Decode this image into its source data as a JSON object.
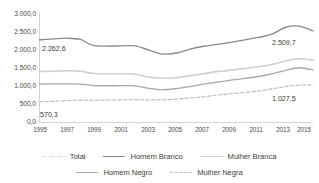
{
  "chart_data": {
    "type": "line",
    "title": "",
    "subtitle": "",
    "xlabel": "",
    "ylabel": "",
    "grid": false,
    "legend_position": "bottom",
    "x": [
      1995,
      1996,
      1997,
      1998,
      1999,
      2001,
      2002,
      2003,
      2004,
      2005,
      2006,
      2007,
      2008,
      2009,
      2011,
      2012,
      2013,
      2014,
      2015
    ],
    "xtick_labels": [
      "1995",
      "1997",
      "1999",
      "2001",
      "2003",
      "2005",
      "2007",
      "2009",
      "2011",
      "2013",
      "2015"
    ],
    "xtick_values": [
      1995,
      1997,
      1999,
      2001,
      2003,
      2005,
      2007,
      2009,
      2011,
      2013,
      2015
    ],
    "ytick_labels": [
      "0,0",
      "500,0",
      "1.000,0",
      "1.500,0",
      "2.000,0",
      "2.500,0",
      "3.000,0"
    ],
    "ytick_values": [
      0,
      500,
      1000,
      1500,
      2000,
      2500,
      3000
    ],
    "ylim": [
      0,
      3000
    ],
    "series": [
      {
        "name": "Total",
        "color": "#d6d6d6",
        "style": "dotted",
        "width": 1.3,
        "values": [
          1390,
          1398,
          1412,
          1402,
          1337,
          1330,
          1320,
          1240,
          1210,
          1225,
          1275,
          1330,
          1390,
          1430,
          1520,
          1585,
          1680,
          1742,
          1700
        ]
      },
      {
        "name": "Homem Branco",
        "color": "#8a8a8a",
        "style": "solid",
        "width": 1.35,
        "values": [
          2262.6,
          2290,
          2310,
          2275,
          2105,
          2100,
          2098,
          1985,
          1875,
          1905,
          2010,
          2090,
          2140,
          2195,
          2330,
          2420,
          2610,
          2640,
          2509.7
        ]
      },
      {
        "name": "Mulher Branca",
        "color": "#cfcfcf",
        "style": "solid",
        "width": 1.3,
        "values": [
          1400,
          1408,
          1420,
          1410,
          1345,
          1338,
          1328,
          1248,
          1218,
          1232,
          1282,
          1338,
          1398,
          1438,
          1528,
          1592,
          1688,
          1750,
          1708
        ]
      },
      {
        "name": "Homem Negro",
        "color": "#a8a8a8",
        "style": "solid",
        "width": 1.3,
        "values": [
          1055,
          1058,
          1060,
          1052,
          1010,
          1008,
          1005,
          935,
          900,
          930,
          985,
          1050,
          1105,
          1160,
          1260,
          1330,
          1430,
          1500,
          1440
        ]
      },
      {
        "name": "Mulher Negra",
        "color": "#bdbdbd",
        "style": "dashed",
        "width": 1.2,
        "values": [
          570.3,
          580,
          600,
          612,
          612,
          620,
          625,
          620,
          622,
          640,
          670,
          705,
          750,
          790,
          860,
          920,
          985,
          1025,
          1027.5
        ]
      }
    ],
    "point_labels": [
      {
        "text": "2.262,6",
        "series": "Homem Branco",
        "x": 1995,
        "value": 2262.6
      },
      {
        "text": "2.509,7",
        "series": "Homem Branco",
        "x": 2015,
        "value": 2509.7
      },
      {
        "text": "570,3",
        "series": "Mulher Negra",
        "x": 1995,
        "value": 570.3
      },
      {
        "text": "1.027,5",
        "series": "Mulher Negra",
        "x": 2015,
        "value": 1027.5
      }
    ]
  },
  "axes": {
    "ytick_labels": [
      "3.000,0",
      "2.500,0",
      "2.000,0",
      "1.500,0",
      "1.000,0",
      "500,0",
      "0,0"
    ],
    "xtick_labels": [
      "1995",
      "1997",
      "1999",
      "2001",
      "2003",
      "2005",
      "2007",
      "2009",
      "2011",
      "2013",
      "2015"
    ]
  },
  "data_labels": {
    "top_left": "2.262,6",
    "top_right": "2.509,7",
    "bottom_left": "570,3",
    "bottom_right": "1.027,5"
  },
  "legend": {
    "row1": [
      {
        "label": "Total",
        "color": "#d6d6d6",
        "style": "dotted"
      },
      {
        "label": "Homem Branco",
        "color": "#8a8a8a",
        "style": "solid"
      },
      {
        "label": "Mulher Branca",
        "color": "#cfcfcf",
        "style": "solid"
      }
    ],
    "row2": [
      {
        "label": "Homem Negro",
        "color": "#a8a8a8",
        "style": "solid"
      },
      {
        "label": "Mulher Negra",
        "color": "#bdbdbd",
        "style": "dashed"
      }
    ]
  },
  "colors": {
    "axis": "#c9c9c9",
    "text": "#4a4a4a",
    "background": "#ffffff"
  }
}
